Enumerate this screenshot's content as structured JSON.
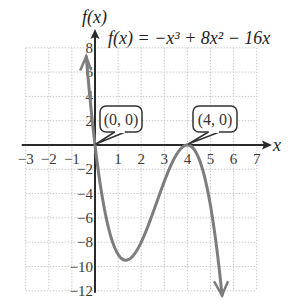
{
  "chart_data": {
    "type": "line",
    "title": "f(x) = −x³ + 8x² − 16x",
    "function": "-x^3 + 8x^2 - 16x",
    "xlabel": "x",
    "ylabel": "f(x)",
    "xlim": [
      -3,
      7
    ],
    "ylim": [
      -12,
      8
    ],
    "x_ticks": [
      -3,
      -2,
      -1,
      1,
      2,
      3,
      4,
      5,
      6,
      7
    ],
    "x_tick_labels": [
      "−3",
      "−2",
      "−1",
      "1",
      "2",
      "3",
      "4",
      "5",
      "6",
      "7"
    ],
    "y_ticks": [
      8,
      6,
      4,
      2,
      -2,
      -4,
      -6,
      -8,
      -10,
      -12
    ],
    "y_tick_labels": [
      "8",
      "6",
      "4",
      "2",
      "−2",
      "−4",
      "−6",
      "−8",
      "−10",
      "−12"
    ],
    "grid": true,
    "grid_step_x": 1,
    "grid_step_y": 2,
    "series": [
      {
        "name": "f(x)",
        "color": "#7a7a7a",
        "x": [
          -0.4,
          -0.2,
          0,
          0.5,
          1,
          1.333,
          2,
          2.5,
          3,
          3.5,
          4,
          4.5,
          5,
          5.5
        ],
        "y": [
          7.74,
          3.53,
          0,
          -6.13,
          -9,
          -9.48,
          -8,
          -5.63,
          -3,
          -0.88,
          0,
          -1.13,
          -5,
          -12.38
        ]
      }
    ],
    "annotations": [
      {
        "text": "(0, 0)",
        "x": 0,
        "y": 0
      },
      {
        "text": "(4, 0)",
        "x": 4,
        "y": 0
      }
    ]
  },
  "labels": {
    "y_axis": "f(x)",
    "x_axis": "x",
    "equation": "f(x) = −x³ + 8x² − 16x",
    "point_a": "(0, 0)",
    "point_b": "(4, 0)"
  }
}
